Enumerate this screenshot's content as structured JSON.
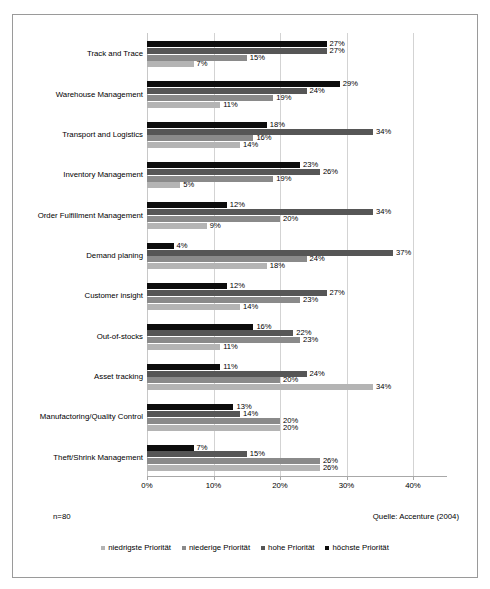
{
  "chart_data": {
    "type": "bar",
    "orientation": "horizontal",
    "title": "",
    "xlabel": "",
    "ylabel": "",
    "xlim": [
      0,
      40
    ],
    "xticks": [
      "0%",
      "10%",
      "20%",
      "30%",
      "40%"
    ],
    "grid": true,
    "legend_position": "bottom",
    "categories": [
      "Track and Trace",
      "Warehouse Management",
      "Transport and Logistics",
      "Inventory Management",
      "Order Fulfillment Management",
      "Demand planing",
      "Customer insight",
      "Out-of-stocks",
      "Asset tracking",
      "Manufactoring/Quality Control",
      "Theft/Shrink Management"
    ],
    "series": [
      {
        "name": "höchste Priorität",
        "color": "#0d0d0d",
        "values": [
          27,
          29,
          18,
          23,
          12,
          4,
          12,
          16,
          11,
          13,
          7
        ],
        "labels": [
          "27%",
          "29%",
          "18%",
          "23%",
          "12%",
          "4%",
          "12%",
          "16%",
          "11%",
          "13%",
          "7%"
        ]
      },
      {
        "name": "hohe Priorität",
        "color": "#565656",
        "values": [
          27,
          24,
          34,
          26,
          34,
          37,
          27,
          22,
          24,
          14,
          15
        ],
        "labels": [
          "27%",
          "24%",
          "34%",
          "26%",
          "34%",
          "37%",
          "27%",
          "22%",
          "24%",
          "14%",
          "15%"
        ]
      },
      {
        "name": "niederige Priorität",
        "color": "#8a8a8a",
        "values": [
          15,
          19,
          16,
          19,
          20,
          24,
          23,
          23,
          20,
          20,
          26
        ],
        "labels": [
          "15%",
          "19%",
          "16%",
          "19%",
          "20%",
          "24%",
          "23%",
          "23%",
          "20%",
          "20%",
          "26%"
        ]
      },
      {
        "name": "niedrigste Priorität",
        "color": "#b4b4b4",
        "values": [
          7,
          11,
          14,
          5,
          9,
          18,
          14,
          11,
          34,
          20,
          26
        ],
        "labels": [
          "7%",
          "11%",
          "14%",
          "5%",
          "9%",
          "18%",
          "14%",
          "11%",
          "34%",
          "20%",
          "26%"
        ]
      }
    ],
    "legend": [
      {
        "label": "niedrigste Priorität",
        "color": "#b4b4b4"
      },
      {
        "label": "niederige Priorität",
        "color": "#8a8a8a"
      },
      {
        "label": "hohe Priorität",
        "color": "#565656"
      },
      {
        "label": "höchste Priorität",
        "color": "#0d0d0d"
      }
    ]
  },
  "footer": {
    "sample_size": "n=80",
    "source": "Quelle: Accenture (2004)"
  }
}
